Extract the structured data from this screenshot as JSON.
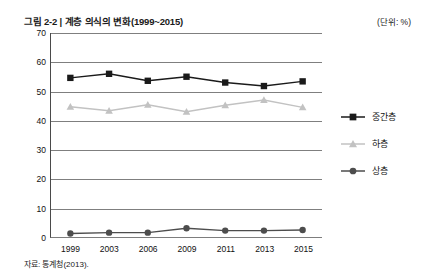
{
  "header": {
    "title": "그림 2-2 | 계층 의식의 변화(1999~2015)",
    "unit_note": "(단위: %)"
  },
  "footer": {
    "source": "자료: 통계청(2013)."
  },
  "legend": {
    "position": "right",
    "items": [
      {
        "label": "중간층",
        "color": "#1a1a1a",
        "marker": "square"
      },
      {
        "label": "하층",
        "color": "#c2c2c2",
        "marker": "triangle"
      },
      {
        "label": "상층",
        "color": "#4d4d4d",
        "marker": "circle"
      }
    ]
  },
  "chart_data": {
    "type": "line",
    "title": "그림 2-2 | 계층 의식의 변화(1999~2015)",
    "subtitle": "",
    "xlabel": "",
    "ylabel": "",
    "unit": "%",
    "categories": [
      "1999",
      "2003",
      "2006",
      "2009",
      "2011",
      "2013",
      "2015"
    ],
    "ylim": [
      0,
      70
    ],
    "yticks": [
      0,
      10,
      20,
      30,
      40,
      50,
      60,
      70
    ],
    "grid": true,
    "series": [
      {
        "name": "중간층",
        "color": "#1a1a1a",
        "marker": "square",
        "values": [
          54.6,
          56.0,
          53.6,
          55.0,
          53.0,
          51.8,
          53.4
        ]
      },
      {
        "name": "하층",
        "color": "#c2c2c2",
        "marker": "triangle",
        "values": [
          44.7,
          43.3,
          45.4,
          43.0,
          45.2,
          47.0,
          44.5
        ]
      },
      {
        "name": "상층",
        "color": "#4d4d4d",
        "marker": "circle",
        "values": [
          1.2,
          1.5,
          1.5,
          3.0,
          2.2,
          2.2,
          2.4
        ]
      }
    ]
  }
}
